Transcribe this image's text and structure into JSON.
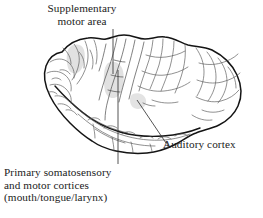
{
  "figure": {
    "background_color": "#ffffff",
    "ink_color": "#1a1a1a",
    "shading_color": "#d8d8d8"
  },
  "labels": {
    "supplementary_motor_area": {
      "line1": "Supplementary",
      "line2": "motor area"
    },
    "auditory_cortex": {
      "line1": "Auditory cortex"
    },
    "primary_somatosensory": {
      "line1": "Primary somatosensory",
      "line2": "and motor cortices",
      "line3": "(mouth/tongue/larynx)"
    }
  }
}
